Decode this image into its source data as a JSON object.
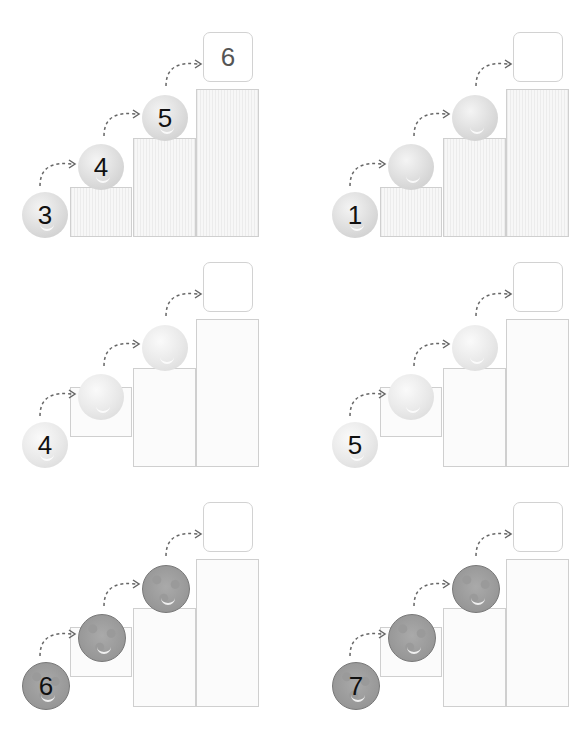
{
  "worksheet": {
    "panels": [
      {
        "start": "3",
        "balls": [
          "3",
          "4",
          "5"
        ],
        "answer": "6",
        "ball_style": "fluffy",
        "step_style": "striped"
      },
      {
        "start": "1",
        "balls": [
          "1",
          "",
          ""
        ],
        "answer": "",
        "ball_style": "fluffy",
        "step_style": "striped"
      },
      {
        "start": "4",
        "balls": [
          "4",
          "",
          ""
        ],
        "answer": "",
        "ball_style": "fluffy2",
        "step_style": "plain"
      },
      {
        "start": "5",
        "balls": [
          "5",
          "",
          ""
        ],
        "answer": "",
        "ball_style": "fluffy2",
        "step_style": "plain"
      },
      {
        "start": "6",
        "balls": [
          "6",
          "",
          ""
        ],
        "answer": "",
        "ball_style": "dotted",
        "step_style": "plain"
      },
      {
        "start": "7",
        "balls": [
          "7",
          "",
          ""
        ],
        "answer": "",
        "ball_style": "dotted",
        "step_style": "plain"
      }
    ]
  },
  "colors": {
    "step_border": "#cfcfcf",
    "arrow": "#666666",
    "text": "#111111"
  }
}
